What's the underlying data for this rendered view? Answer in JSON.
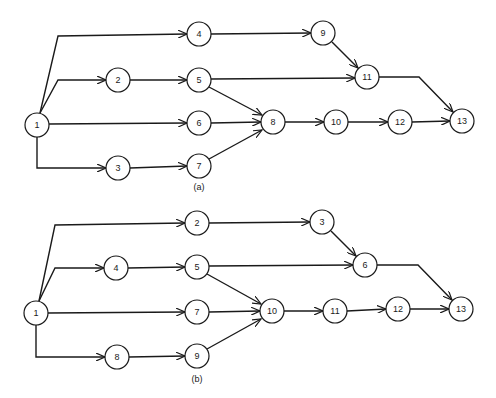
{
  "figure": {
    "diagrams": [
      {
        "id": "a",
        "caption": "(a)",
        "caption_pos": [
          199,
          190
        ],
        "nodes": [
          {
            "label": "1",
            "x": 37,
            "y": 125
          },
          {
            "label": "2",
            "x": 118,
            "y": 80
          },
          {
            "label": "3",
            "x": 118,
            "y": 168
          },
          {
            "label": "4",
            "x": 199,
            "y": 34
          },
          {
            "label": "5",
            "x": 199,
            "y": 80
          },
          {
            "label": "6",
            "x": 199,
            "y": 123
          },
          {
            "label": "7",
            "x": 199,
            "y": 166
          },
          {
            "label": "8",
            "x": 273,
            "y": 122
          },
          {
            "label": "9",
            "x": 323,
            "y": 33
          },
          {
            "label": "10",
            "x": 336,
            "y": 122
          },
          {
            "label": "11",
            "x": 367,
            "y": 77
          },
          {
            "label": "12",
            "x": 400,
            "y": 122
          },
          {
            "label": "13",
            "x": 462,
            "y": 121
          }
        ],
        "edges": [
          {
            "from": "1",
            "to": "4",
            "path": "M40,113 L58,36 L187,34"
          },
          {
            "from": "1",
            "to": "2",
            "path": "M40,113 L58,80 L106,80"
          },
          {
            "from": "1",
            "to": "6",
            "path": "M49,124 L187,123"
          },
          {
            "from": "1",
            "to": "3",
            "path": "M37,137 L37,168 L106,168"
          },
          {
            "from": "2",
            "to": "5",
            "path": "M130,80 L187,80"
          },
          {
            "from": "3",
            "to": "7",
            "path": "M130,168 L187,166"
          },
          {
            "from": "4",
            "to": "9",
            "path": "M211,34 L311,33"
          },
          {
            "from": "5",
            "to": "11",
            "path": "M211,79 L355,78"
          },
          {
            "from": "5",
            "to": "8",
            "path": "M209,87 L262,115"
          },
          {
            "from": "6",
            "to": "8",
            "path": "M211,123 L261,122"
          },
          {
            "from": "7",
            "to": "8",
            "path": "M209,159 L262,130"
          },
          {
            "from": "9",
            "to": "11",
            "path": "M332,42 L358,68"
          },
          {
            "from": "11",
            "to": "13",
            "path": "M379,77 L419,77 L453,112"
          },
          {
            "from": "8",
            "to": "10",
            "path": "M285,122 L324,122"
          },
          {
            "from": "10",
            "to": "12",
            "path": "M348,122 L388,122"
          },
          {
            "from": "12",
            "to": "13",
            "path": "M412,122 L450,121"
          }
        ]
      },
      {
        "id": "b",
        "caption": "(b)",
        "caption_pos": [
          197,
          382
        ],
        "nodes": [
          {
            "label": "1",
            "x": 36,
            "y": 313
          },
          {
            "label": "2",
            "x": 197,
            "y": 223
          },
          {
            "label": "3",
            "x": 322,
            "y": 222
          },
          {
            "label": "4",
            "x": 116,
            "y": 268
          },
          {
            "label": "5",
            "x": 197,
            "y": 267
          },
          {
            "label": "6",
            "x": 365,
            "y": 265
          },
          {
            "label": "7",
            "x": 197,
            "y": 312
          },
          {
            "label": "8",
            "x": 117,
            "y": 357
          },
          {
            "label": "9",
            "x": 197,
            "y": 356
          },
          {
            "label": "10",
            "x": 272,
            "y": 311
          },
          {
            "label": "11",
            "x": 335,
            "y": 311
          },
          {
            "label": "12",
            "x": 398,
            "y": 309
          },
          {
            "label": "13",
            "x": 461,
            "y": 309
          }
        ],
        "edges": [
          {
            "from": "1",
            "to": "2",
            "path": "M39,301 L55,225 L185,223"
          },
          {
            "from": "1",
            "to": "4",
            "path": "M39,301 L55,268 L104,268"
          },
          {
            "from": "1",
            "to": "7",
            "path": "M48,313 L185,312"
          },
          {
            "from": "1",
            "to": "8",
            "path": "M36,325 L36,357 L105,357"
          },
          {
            "from": "4",
            "to": "5",
            "path": "M128,268 L185,267"
          },
          {
            "from": "8",
            "to": "9",
            "path": "M129,357 L185,356"
          },
          {
            "from": "2",
            "to": "3",
            "path": "M209,223 L310,222"
          },
          {
            "from": "5",
            "to": "6",
            "path": "M209,266 L353,265"
          },
          {
            "from": "5",
            "to": "10",
            "path": "M207,274 L261,304"
          },
          {
            "from": "7",
            "to": "10",
            "path": "M209,312 L260,311"
          },
          {
            "from": "9",
            "to": "10",
            "path": "M207,349 L261,319"
          },
          {
            "from": "3",
            "to": "6",
            "path": "M331,231 L356,256"
          },
          {
            "from": "6",
            "to": "13",
            "path": "M377,265 L418,265 L452,300"
          },
          {
            "from": "10",
            "to": "11",
            "path": "M284,311 L323,311"
          },
          {
            "from": "11",
            "to": "12",
            "path": "M347,311 L386,309"
          },
          {
            "from": "12",
            "to": "13",
            "path": "M410,309 L449,309"
          }
        ]
      }
    ]
  }
}
